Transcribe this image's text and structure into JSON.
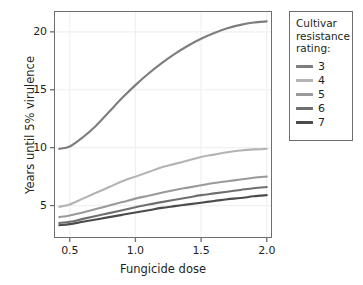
{
  "chart_data": {
    "type": "line",
    "title": "",
    "xlabel": "Fungicide dose",
    "ylabel": "Years until 5% virulence",
    "xlim": [
      0.38,
      2.04
    ],
    "ylim": [
      2.2,
      21.8
    ],
    "xticks": [
      "0.5",
      "1.0",
      "1.5",
      "2.0"
    ],
    "xtick_values": [
      0.5,
      1.0,
      1.5,
      2.0
    ],
    "yticks": [
      "5",
      "10",
      "15",
      "20"
    ],
    "ytick_values": [
      5,
      10,
      15,
      20
    ],
    "grid": true,
    "grid_color": "#f0f0f0",
    "legend_position": "right",
    "legend_title": "Cultivar resistance rating:",
    "x": [
      0.42,
      0.5,
      0.6,
      0.7,
      0.8,
      0.9,
      1.0,
      1.1,
      1.2,
      1.3,
      1.4,
      1.5,
      1.6,
      1.7,
      1.8,
      1.9,
      2.0
    ],
    "series": [
      {
        "name": "3",
        "color": "#7d7d7d",
        "values": [
          9.9,
          10.1,
          10.9,
          11.9,
          13.1,
          14.3,
          15.4,
          16.4,
          17.3,
          18.1,
          18.8,
          19.4,
          19.9,
          20.3,
          20.6,
          20.8,
          20.9
        ]
      },
      {
        "name": "4",
        "color": "#b3b3b3",
        "values": [
          4.9,
          5.1,
          5.6,
          6.1,
          6.6,
          7.1,
          7.5,
          7.9,
          8.3,
          8.6,
          8.9,
          9.2,
          9.4,
          9.6,
          9.75,
          9.85,
          9.9
        ]
      },
      {
        "name": "5",
        "color": "#9a9a9a",
        "values": [
          4.0,
          4.15,
          4.4,
          4.7,
          5.0,
          5.3,
          5.6,
          5.85,
          6.1,
          6.35,
          6.55,
          6.75,
          6.95,
          7.1,
          7.25,
          7.4,
          7.5
        ]
      },
      {
        "name": "6",
        "color": "#6f6f6f",
        "values": [
          3.5,
          3.6,
          3.85,
          4.1,
          4.35,
          4.6,
          4.85,
          5.1,
          5.3,
          5.5,
          5.7,
          5.9,
          6.05,
          6.2,
          6.35,
          6.5,
          6.6
        ]
      },
      {
        "name": "7",
        "color": "#4b4b4b",
        "values": [
          3.3,
          3.4,
          3.6,
          3.8,
          4.0,
          4.2,
          4.4,
          4.6,
          4.8,
          4.95,
          5.1,
          5.25,
          5.4,
          5.55,
          5.65,
          5.8,
          5.9
        ]
      }
    ]
  },
  "legend": {
    "title_lines": [
      "Cultivar",
      "resistance",
      "rating:"
    ],
    "items": [
      {
        "label": "3",
        "color": "#7d7d7d"
      },
      {
        "label": "4",
        "color": "#b3b3b3"
      },
      {
        "label": "5",
        "color": "#9a9a9a"
      },
      {
        "label": "6",
        "color": "#6f6f6f"
      },
      {
        "label": "7",
        "color": "#4b4b4b"
      }
    ]
  },
  "axes": {
    "x_title": "Fungicide dose",
    "y_title": "Years until 5% virulence"
  }
}
